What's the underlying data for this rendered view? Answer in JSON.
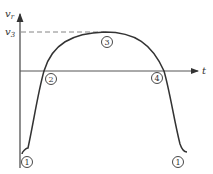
{
  "diagram": {
    "y_axis": {
      "label": "v",
      "label_sub": "r",
      "ref_label": "v",
      "ref_sub": "3"
    },
    "x_axis": {
      "label": "t"
    },
    "markers": [
      {
        "id": "1-left",
        "label": "1"
      },
      {
        "id": "2",
        "label": "2"
      },
      {
        "id": "3",
        "label": "3"
      },
      {
        "id": "4",
        "label": "4"
      },
      {
        "id": "1-right",
        "label": "1"
      }
    ],
    "colors": {
      "stroke": "#333333",
      "dash": "#777777",
      "axis": "#555555"
    }
  }
}
